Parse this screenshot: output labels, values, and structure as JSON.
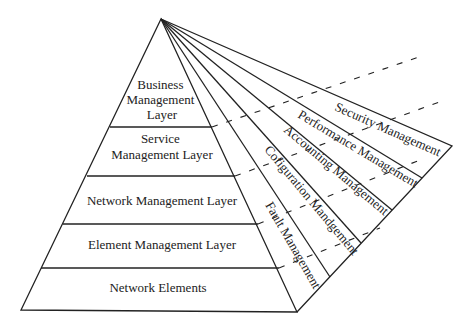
{
  "diagram": {
    "layers": [
      {
        "lines": [
          "Business",
          "Management",
          "Layer"
        ]
      },
      {
        "lines": [
          "Service",
          "Management Layer"
        ]
      },
      {
        "lines": [
          "Network Management Layer"
        ]
      },
      {
        "lines": [
          "Element Management Layer"
        ]
      },
      {
        "lines": [
          "Network Elements"
        ]
      }
    ],
    "functional_areas": [
      "Security Management",
      "Performance Management",
      "Accounting Management",
      "Cofiguration Mandgement",
      "Fault Management"
    ],
    "colors": {
      "line": "#222222",
      "background": "#ffffff",
      "text": "#222222"
    }
  }
}
